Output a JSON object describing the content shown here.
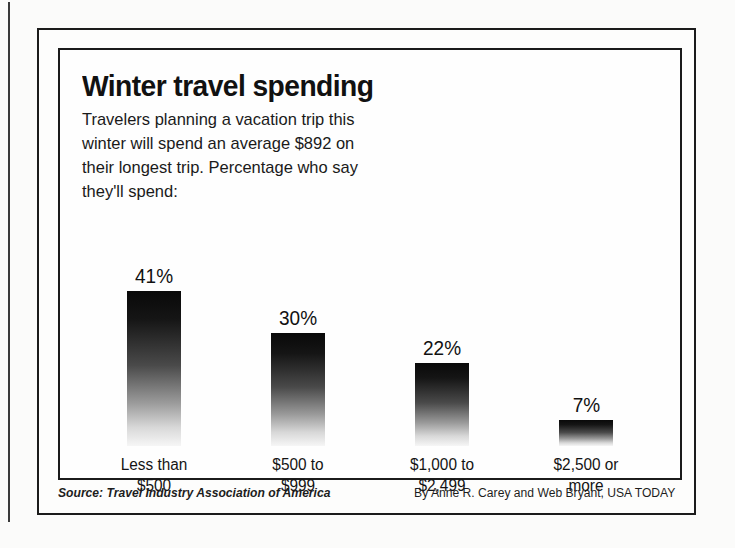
{
  "page": {
    "background_color": "#fbfbfa",
    "frame_color": "#1b1b1b"
  },
  "chart_data": {
    "type": "bar",
    "title": "Winter travel spending",
    "subtitle": "Travelers planning a vacation trip this winter will spend an average $892 on their longest trip. Percentage who say they'll spend:",
    "categories": [
      "Less than $500",
      "$500 to $999",
      "$1,000 to $2,499",
      "$2,500 or more"
    ],
    "category_lines": [
      [
        "Less than",
        "$500"
      ],
      [
        "$500 to",
        "$999"
      ],
      [
        "$1,000 to",
        "$2,499"
      ],
      [
        "$2,500 or",
        "more"
      ]
    ],
    "values": [
      41,
      30,
      22,
      7
    ],
    "value_labels": [
      "41%",
      "30%",
      "22%",
      "7%"
    ],
    "xlabel": "",
    "ylabel": "",
    "ylim": [
      0,
      45
    ],
    "grid": false,
    "legend": false,
    "bar_gradient_from": "#090909",
    "bar_gradient_to": "#f6f6f6"
  },
  "footer": {
    "source": "Source: Travel Industry Association of America",
    "credit": "By Anne R. Carey and Web Bryant, USA TODAY"
  }
}
